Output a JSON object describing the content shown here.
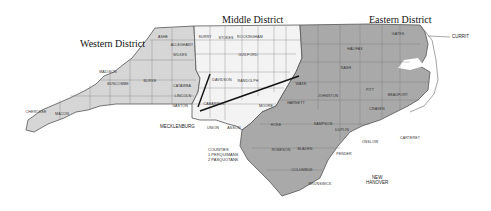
{
  "districts": {
    "western": {
      "title": "Western District",
      "color": "#d6d6d6"
    },
    "middle": {
      "title": "Middle District",
      "color": "#f3f3f3"
    },
    "eastern": {
      "title": "Eastern District",
      "color": "#a9a9a9"
    }
  },
  "outside_labels": {
    "mecklenburg": "MECKLENBURG",
    "new_hanover_1": "NEW",
    "new_hanover_2": "HANOVER",
    "currituck": "CURRIT"
  },
  "legend": {
    "title": "COUNTIES",
    "items": [
      "1  PERQUIMANS",
      "2  PASQUOTANK"
    ]
  },
  "counties": {
    "western": [
      "ASHE",
      "WATA UGA",
      "ALLEGHANY",
      "WILKES",
      "CALDWELL",
      "ALEX ANDER",
      "IREDELL",
      "AVERY",
      "MITCHELL",
      "YANCEY",
      "MADISON",
      "BUNCOMBE",
      "McDOWELL",
      "BURKE",
      "CATAWBA",
      "LINCOLN",
      "GASTON",
      "CLEVELAND",
      "RUTHERFORD",
      "POLK",
      "HENDERSON",
      "TRANSYLVANIA",
      "HAYWOOD",
      "SWAIN",
      "JACKSON",
      "MACON",
      "GRAHAM",
      "CHEROKEE",
      "CLAY"
    ],
    "middle": [
      "SURRY",
      "STOKES",
      "ROCKINGHAM",
      "CASWELL",
      "PERSON",
      "YADKIN",
      "FORSYTH",
      "GUILFORD",
      "ALAMANCE",
      "ORANGE",
      "DURHAM",
      "DAVIE",
      "DAVIDSON",
      "RANDOLPH",
      "CHATHAM",
      "ROWAN",
      "CABARRUS",
      "STANLY",
      "MONTGOMERY",
      "MOORE",
      "LEE",
      "UNION",
      "ANSON",
      "RICHMOND",
      "SCOTLAND",
      "HOKE"
    ],
    "eastern": [
      "GRANVILLE",
      "VANCE",
      "WARREN",
      "NORTHAMPTON",
      "HERTFORD",
      "GATES",
      "CAMDEN",
      "FRANKLIN",
      "HALIFAX",
      "BERTIE",
      "CHOWAN",
      "NASH",
      "EDGECOMBE",
      "MARTIN",
      "WASHINGTON",
      "TYRRELL",
      "DARE",
      "WAKE",
      "WILSON",
      "PITT",
      "BEAUFORT",
      "HYDE",
      "JOHNSTON",
      "GREENE",
      "HARNETT",
      "WAYNE",
      "LENOIR",
      "CRAVEN",
      "PAMLICO",
      "CUMBERLAND",
      "SAMPSON",
      "DUPLIN",
      "JONES",
      "ONSLOW",
      "CARTERET",
      "ROBESON",
      "BLADEN",
      "PENDER",
      "COLUMBUS",
      "BRUNSWICK"
    ]
  }
}
